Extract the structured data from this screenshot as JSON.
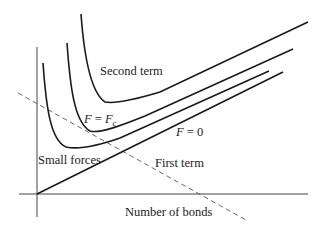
{
  "diagram": {
    "labels": {
      "second_term": "Second term",
      "first_term": "First term",
      "small_forces": "Small forces",
      "f_eq_fc": "F = Fc",
      "f_eq_fc_parts": {
        "lhs": "F",
        "eq": " = ",
        "rhs": "F",
        "sub": "c"
      },
      "f_eq_zero": "F = 0",
      "f_eq_zero_parts": {
        "lhs": "F",
        "eq": " = 0"
      },
      "x_axis": "Number of bonds"
    },
    "elements": [
      {
        "name": "y-axis",
        "type": "axis"
      },
      {
        "name": "x-axis",
        "type": "axis"
      },
      {
        "name": "second-term-curve",
        "type": "curve",
        "desc": "steep outer hyperbola-like curve, min near (102,102), rising linearly to top-right"
      },
      {
        "name": "f-eq-fc-curve",
        "type": "curve",
        "desc": "middle curve, min near (87,130)"
      },
      {
        "name": "small-forces-curve",
        "type": "curve",
        "desc": "inner curve, min near (65,147)"
      },
      {
        "name": "first-term-line",
        "type": "line",
        "desc": "straight line from origin (37,194) rising to right; labeled F = 0"
      },
      {
        "name": "dashed-diagonal",
        "type": "dashed-line",
        "desc": "dashed line descending from upper-left to lower-right"
      }
    ]
  }
}
